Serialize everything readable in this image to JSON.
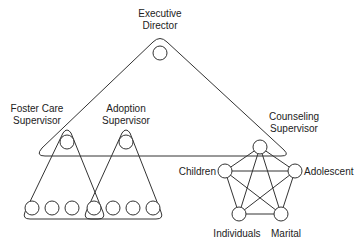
{
  "diagram": {
    "executive": {
      "line1": "Executive",
      "line2": "Director"
    },
    "foster": {
      "line1": "Foster Care",
      "line2": "Supervisor"
    },
    "adoption": {
      "line1": "Adoption",
      "line2": "Supervisor"
    },
    "counseling": {
      "line1": "Counseling",
      "line2": "Supervisor"
    },
    "pentagon_labels": {
      "children": "Children",
      "adolescent": "Adolescent",
      "individuals": "Individuals",
      "marital": "Marital"
    },
    "bottom_worker_count": 7,
    "structure": "Hierarchical group triangles (executive over supervisors) with fully connected counseling team pentagon"
  }
}
